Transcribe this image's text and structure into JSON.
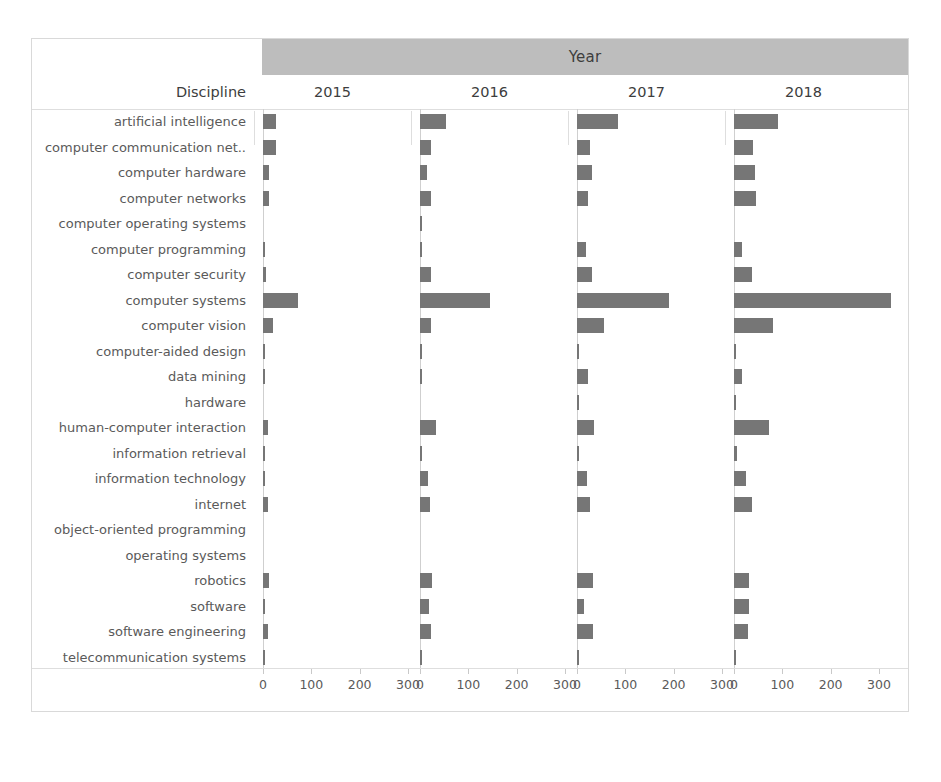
{
  "header": {
    "group_label": "Year",
    "discipline_label": "Discipline"
  },
  "axis": {
    "ticks": [
      0,
      100,
      200,
      300
    ],
    "tick_labels": [
      "0",
      "100",
      "200",
      "300"
    ],
    "max": 340
  },
  "colors": {
    "bar": "#767676",
    "header_band": "#bdbdbd",
    "grid": "#dedede",
    "text": "#5a5a5a",
    "frame": "#d9d9d9"
  },
  "chart_data": {
    "type": "bar",
    "title": "",
    "xlabel": "",
    "ylabel": "Discipline",
    "orientation": "horizontal",
    "facet_by": "Year",
    "grid": false,
    "legend": "none",
    "xlim": [
      0,
      340
    ],
    "categories": [
      "artificial intelligence",
      "computer communication net..",
      "computer hardware",
      "computer networks",
      "computer operating systems",
      "computer programming",
      "computer security",
      "computer systems",
      "computer vision",
      "computer-aided design",
      "data mining",
      "hardware",
      "human-computer interaction",
      "information retrieval",
      "information technology",
      "internet",
      "object-oriented programming",
      "operating systems",
      "robotics",
      "software",
      "software engineering",
      "telecommunication systems"
    ],
    "series": [
      {
        "name": "2015",
        "values": [
          26,
          26,
          12,
          13,
          0,
          3,
          7,
          73,
          20,
          3,
          4,
          0,
          10,
          4,
          4,
          11,
          0,
          0,
          12,
          3,
          11,
          3
        ]
      },
      {
        "name": "2016",
        "values": [
          53,
          22,
          15,
          22,
          2,
          5,
          22,
          145,
          22,
          3,
          3,
          0,
          33,
          3,
          16,
          21,
          0,
          0,
          24,
          18,
          22,
          2
        ]
      },
      {
        "name": "2017",
        "values": [
          85,
          26,
          32,
          22,
          0,
          19,
          31,
          190,
          55,
          3,
          23,
          3,
          36,
          4,
          20,
          26,
          0,
          0,
          33,
          14,
          33,
          2
        ]
      },
      {
        "name": "2018",
        "values": [
          92,
          40,
          44,
          46,
          0,
          16,
          38,
          325,
          80,
          3,
          17,
          2,
          73,
          7,
          25,
          38,
          0,
          0,
          32,
          30,
          29,
          3
        ]
      }
    ]
  }
}
